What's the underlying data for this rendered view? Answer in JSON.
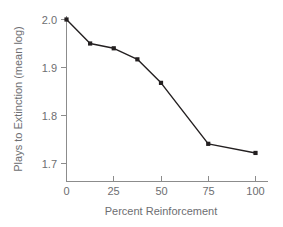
{
  "chart_data": {
    "type": "line",
    "title": "",
    "xlabel": "Percent Reinforcement",
    "ylabel": "Plays to Extinction (mean log)",
    "x": [
      0,
      12.5,
      25,
      37.5,
      50,
      75,
      100
    ],
    "values": [
      2.0,
      1.95,
      1.94,
      1.917,
      1.868,
      1.741,
      1.722
    ],
    "series": [
      {
        "name": "Plays to Extinction",
        "values": [
          2.0,
          1.95,
          1.94,
          1.917,
          1.868,
          1.741,
          1.722
        ]
      }
    ],
    "xlim": [
      0,
      100
    ],
    "ylim": [
      1.7,
      2.0
    ],
    "xticks": [
      0,
      25,
      50,
      75,
      100
    ],
    "yticks": [
      1.7,
      1.8,
      1.9,
      2.0
    ],
    "xtick_labels": [
      "0",
      "25",
      "50",
      "75",
      "100"
    ],
    "ytick_labels": [
      "1.7",
      "1.8",
      "1.9",
      "2.0"
    ],
    "grid": false,
    "legend": false,
    "legend_position": "none",
    "marker": "filled-square",
    "line_color": "#231f20",
    "marker_color": "#231f20",
    "axis_color": "#8c8c8c",
    "text_color": "#6d6e71",
    "background_color": "#ffffff"
  },
  "axes": {
    "y_title": "Plays to Extinction (mean log)",
    "x_title": "Percent Reinforcement",
    "y_labels": {
      "t0": "1.7",
      "t1": "1.8",
      "t2": "1.9",
      "t3": "2.0"
    },
    "x_labels": {
      "t0": "0",
      "t1": "25",
      "t2": "50",
      "t3": "75",
      "t4": "100"
    }
  }
}
